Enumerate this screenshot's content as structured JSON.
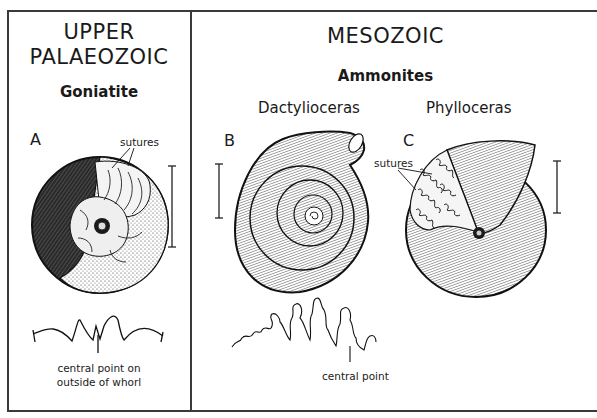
{
  "left_panel": {
    "era_line1": "UPPER",
    "era_line2": "PALAEOZOIC",
    "group": "Goniatite",
    "specimen_letter": "A",
    "sutures_label": "sutures",
    "suture_caption_line1": "central point on",
    "suture_caption_line2": "outside of whorl"
  },
  "right_panel": {
    "era": "MESOZOIC",
    "group": "Ammonites",
    "specimens": [
      {
        "letter": "B",
        "genus": "Dactylioceras"
      },
      {
        "letter": "C",
        "genus": "Phylloceras",
        "sutures_label": "sutures"
      }
    ],
    "suture_caption": "central point"
  },
  "colors": {
    "ink": "#1a1a1a",
    "frame": "#3a3a3a",
    "background": "#ffffff"
  }
}
